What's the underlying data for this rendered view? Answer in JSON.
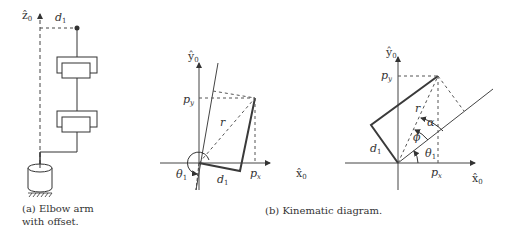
{
  "panel_a": {
    "axis_label": "ẑ",
    "axis_sub": "0",
    "offset_label": "d",
    "offset_sub": "1",
    "caption_line1": "(a) Elbow arm",
    "caption_line2": "with offset."
  },
  "panel_b": {
    "caption": "(b) Kinematic diagram.",
    "left": {
      "y_axis": "ŷ",
      "y_sub": "0",
      "x_axis": "x̂",
      "x_sub": "0",
      "py": "p",
      "py_sub": "y",
      "px": "p",
      "px_sub": "x",
      "r": "r",
      "theta": "θ",
      "theta_sub": "1",
      "d": "d",
      "d_sub": "1"
    },
    "right": {
      "y_axis": "ŷ",
      "y_sub": "0",
      "x_axis": "x̂",
      "x_sub": "0",
      "py": "p",
      "py_sub": "y",
      "px": "p",
      "px_sub": "x",
      "r": "r",
      "alpha": "α",
      "phi": "ϕ",
      "theta": "θ",
      "theta_sub": "1",
      "d": "d",
      "d_sub": "1"
    }
  },
  "colors": {
    "line": "#333333",
    "dash": "#555555",
    "link": "#3a3a3a"
  }
}
